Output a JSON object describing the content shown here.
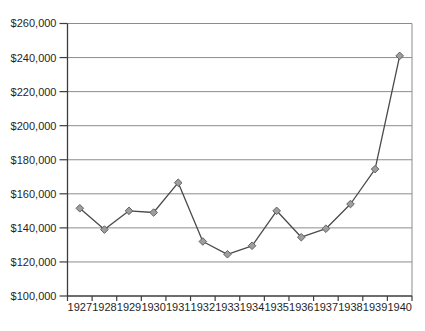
{
  "figure": {
    "title": ""
  },
  "chart_data": {
    "type": "line",
    "title": "",
    "xlabel": "",
    "ylabel": "",
    "categories": [
      "1927",
      "1928",
      "1929",
      "1930",
      "1931",
      "1932",
      "1933",
      "1934",
      "1935",
      "1936",
      "1937",
      "1938",
      "1939",
      "1940"
    ],
    "values": [
      151500,
      139000,
      150000,
      149000,
      166500,
      132000,
      124500,
      129500,
      150000,
      134500,
      139500,
      154000,
      174500,
      241000
    ],
    "ylim": [
      100000,
      260000
    ],
    "ytick_interval": 20000,
    "ytick_labels": [
      "$100,000",
      "$120,000",
      "$140,000",
      "$160,000",
      "$180,000",
      "$200,000",
      "$220,000",
      "$240,000",
      "$260,000"
    ],
    "grid": true,
    "legend": "none",
    "marker": "diamond",
    "colors": {
      "background": "#ffffff",
      "line": "#4a4a4a",
      "marker_fill": "#9e9e9e",
      "marker_stroke": "#636363",
      "gridline": "#8c8c8c",
      "axis": "#3d3d3d",
      "label": "#1f1f1f"
    }
  }
}
